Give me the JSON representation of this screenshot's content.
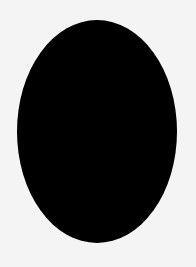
{
  "canvas": {
    "width": 196,
    "height": 267,
    "background_color": "#f4f4f4"
  },
  "shape": {
    "type": "ellipse",
    "fill_color": "#000000",
    "center_x": 97,
    "center_y": 131,
    "width": 160,
    "height": 223
  }
}
